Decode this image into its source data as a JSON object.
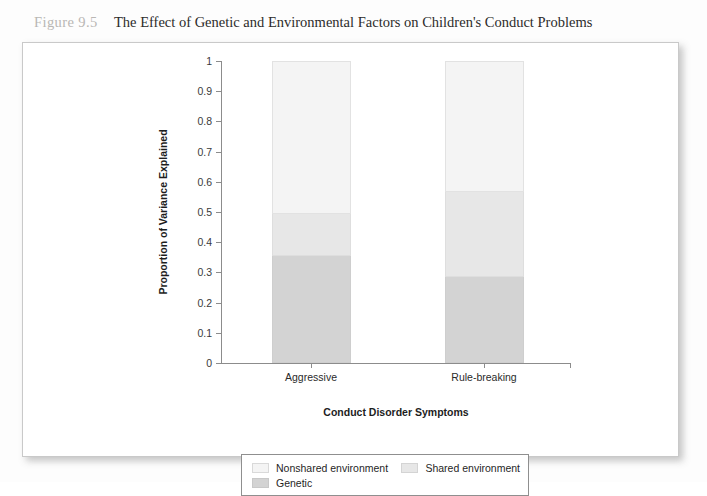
{
  "figure": {
    "number": "Figure 9.5",
    "title": "The Effect of Genetic and Environmental Factors on Children's Conduct Problems"
  },
  "legend": {
    "nonshared_label": "Nonshared environment",
    "shared_label": "Shared environment",
    "genetic_label": "Genetic"
  },
  "colors": {
    "nonshared": "#f4f4f4",
    "shared": "#e7e7e7",
    "genetic": "#d3d3d3",
    "axis": "#8c8c8c",
    "fignum": "#b9b7b4",
    "title": "#2c2b2a"
  },
  "chart_data": {
    "type": "bar",
    "stacked": true,
    "title": "The Effect of Genetic and Environmental Factors on Children's Conduct Problems",
    "xlabel": "Conduct Disorder Symptoms",
    "ylabel": "Proportion of Variance Explained",
    "categories": [
      "Aggressive",
      "Rule-breaking"
    ],
    "ylim": [
      0,
      1
    ],
    "yticks": [
      "0",
      "0.1",
      "0.2",
      "0.3",
      "0.4",
      "0.5",
      "0.6",
      "0.7",
      "0.8",
      "0.9",
      "1"
    ],
    "grid": false,
    "legend_position": "bottom",
    "series": [
      {
        "name": "Genetic",
        "values": [
          0.355,
          0.285
        ]
      },
      {
        "name": "Shared environment",
        "values": [
          0.14,
          0.28
        ]
      },
      {
        "name": "Nonshared environment",
        "values": [
          0.505,
          0.435
        ]
      }
    ],
    "cumulative_boundaries": {
      "Aggressive": [
        0.355,
        0.495,
        1.0
      ],
      "Rule-breaking": [
        0.285,
        0.565,
        1.0
      ]
    }
  }
}
